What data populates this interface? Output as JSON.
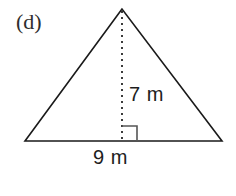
{
  "figure": {
    "part_label": "(d)",
    "shape": "triangle",
    "background_color": "#ffffff",
    "stroke_color": "#1a1a1a",
    "text_color": "#1d1d1d",
    "labels": {
      "height": "7 m",
      "base": "9 m"
    },
    "annotations": {
      "right_angle_marker": "right-angle",
      "altitude_style": "dotted"
    },
    "geometry": {
      "apex": [
        122,
        9
      ],
      "bottom_left": [
        25,
        141
      ],
      "bottom_right": [
        222,
        141
      ],
      "foot_of_altitude": [
        122,
        141
      ],
      "right_angle_size": 15
    },
    "measurements": {
      "height_value": 7,
      "height_unit": "m",
      "base_value": 9,
      "base_unit": "m"
    }
  }
}
